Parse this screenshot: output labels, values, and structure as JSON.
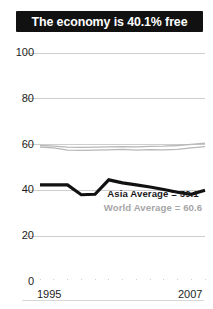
{
  "title": {
    "text": "The economy is 40.1% free",
    "background_color": "#111111",
    "text_color": "#ffffff"
  },
  "legend": {
    "position": "inside-bottom-right",
    "entries": [
      {
        "label": "Asia Average = 59.1",
        "color": "#1a1a1a",
        "series": "world-line-upper"
      },
      {
        "label": "World Average = 60.6",
        "color": "#a6a6a6",
        "series": "world-line-lower"
      }
    ]
  },
  "axes": {
    "y_ticks": [
      "100",
      "80",
      "60",
      "40",
      "20",
      "0"
    ],
    "x_ticks": [
      "1995",
      "2007"
    ],
    "y_label": "",
    "x_label": ""
  },
  "colors": {
    "country_line": "#111111",
    "reference_line": "#b8b8b8",
    "gridline": "#c9c9c9",
    "axis_text": "#1d1d1d",
    "banner": "#111111",
    "bottom_rule": "#d8d8d8"
  },
  "chart_data": {
    "type": "line",
    "title": "The economy is 40.1% free",
    "xlabel": "",
    "ylabel": "",
    "xlim": [
      1995,
      2007
    ],
    "ylim": [
      0,
      100
    ],
    "grid": true,
    "gridlines": [
      0,
      20,
      40,
      60,
      80,
      100
    ],
    "x": [
      1995,
      1996,
      1997,
      1998,
      1999,
      2000,
      2001,
      2002,
      2003,
      2004,
      2005,
      2006,
      2007
    ],
    "series": [
      {
        "name": "Country score",
        "color": "#111111",
        "width": 3.2,
        "values": [
          42.4,
          42.4,
          42.4,
          38.1,
          38.3,
          44.6,
          43.3,
          42.4,
          41.5,
          40.4,
          39.2,
          38.3,
          40.1
        ]
      },
      {
        "name": "Asia Average",
        "color": "#b8b8b8",
        "width": 1.3,
        "values": [
          58.9,
          58.6,
          57.6,
          57.5,
          57.6,
          57.7,
          57.9,
          57.6,
          57.8,
          57.7,
          57.9,
          58.6,
          59.1
        ]
      },
      {
        "name": "World Average",
        "color": "#b8b8b8",
        "width": 1.3,
        "values": [
          59.6,
          59.3,
          58.9,
          58.8,
          58.9,
          59.0,
          59.1,
          59.0,
          59.2,
          59.3,
          59.6,
          60.1,
          60.6
        ]
      }
    ],
    "annotations": [
      {
        "text": "Asia Average = 59.1",
        "color": "#1a1a1a"
      },
      {
        "text": "World Average = 60.6",
        "color": "#a6a6a6"
      }
    ]
  }
}
